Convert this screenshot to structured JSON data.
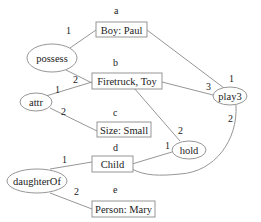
{
  "diagram": {
    "type": "conceptual-graph",
    "concepts": [
      {
        "id": "a",
        "label": "a",
        "text": "Boy: Paul"
      },
      {
        "id": "b",
        "label": "b",
        "text": "Firetruck, Toy"
      },
      {
        "id": "c",
        "label": "c",
        "text": "Size: Small"
      },
      {
        "id": "d",
        "label": "d",
        "text": "Child"
      },
      {
        "id": "e",
        "label": "e",
        "text": "Person: Mary"
      }
    ],
    "relations": [
      {
        "id": "possess",
        "text": "possess"
      },
      {
        "id": "attr",
        "text": "attr"
      },
      {
        "id": "play3",
        "text": "play3"
      },
      {
        "id": "hold",
        "text": "hold"
      },
      {
        "id": "daughterOf",
        "text": "daughterOf"
      }
    ],
    "edges": [
      {
        "relation": "possess",
        "concept": "a",
        "arg": "1"
      },
      {
        "relation": "possess",
        "concept": "b",
        "arg": "2"
      },
      {
        "relation": "attr",
        "concept": "b",
        "arg": "1"
      },
      {
        "relation": "attr",
        "concept": "c",
        "arg": "2"
      },
      {
        "relation": "play3",
        "concept": "a",
        "arg": "1"
      },
      {
        "relation": "play3",
        "concept": "b",
        "arg": "3"
      },
      {
        "relation": "play3",
        "concept": "d",
        "arg": "2"
      },
      {
        "relation": "hold",
        "concept": "b",
        "arg": "2"
      },
      {
        "relation": "hold",
        "concept": "d",
        "arg": "1"
      },
      {
        "relation": "daughterOf",
        "concept": "d",
        "arg": "1"
      },
      {
        "relation": "daughterOf",
        "concept": "e",
        "arg": "2"
      }
    ]
  }
}
